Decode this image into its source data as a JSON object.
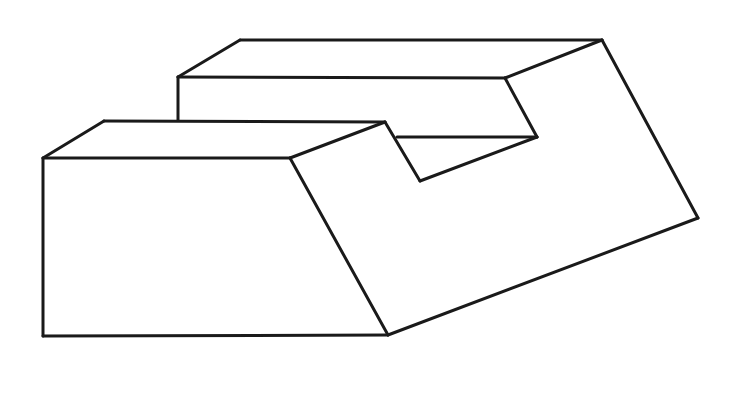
{
  "figure": {
    "type": "isometric-line-drawing",
    "stroke_color": "#1a1a1a",
    "background": "#ffffff",
    "vertices": {
      "A": [
        240,
        40
      ],
      "B": [
        602,
        40
      ],
      "C": [
        178,
        77
      ],
      "D": [
        505,
        78
      ],
      "E": [
        178,
        120
      ],
      "F": [
        104,
        121
      ],
      "G": [
        43,
        158
      ],
      "H": [
        290,
        158
      ],
      "I": [
        385,
        122
      ],
      "J": [
        537,
        137
      ],
      "K": [
        397,
        137
      ],
      "L": [
        420,
        181
      ],
      "M": [
        698,
        218
      ],
      "N": [
        388,
        335
      ],
      "O": [
        43,
        336
      ]
    },
    "edges": [
      [
        "A",
        "B"
      ],
      [
        "A",
        "C"
      ],
      [
        "C",
        "D"
      ],
      [
        "B",
        "D"
      ],
      [
        "C",
        "E"
      ],
      [
        "F",
        "I"
      ],
      [
        "F",
        "G"
      ],
      [
        "G",
        "H"
      ],
      [
        "H",
        "I"
      ],
      [
        "D",
        "J"
      ],
      [
        "J",
        "K"
      ],
      [
        "I",
        "L"
      ],
      [
        "L",
        "J"
      ],
      [
        "B",
        "M"
      ],
      [
        "M",
        "N"
      ],
      [
        "N",
        "H"
      ],
      [
        "G",
        "O"
      ],
      [
        "O",
        "N"
      ]
    ]
  }
}
